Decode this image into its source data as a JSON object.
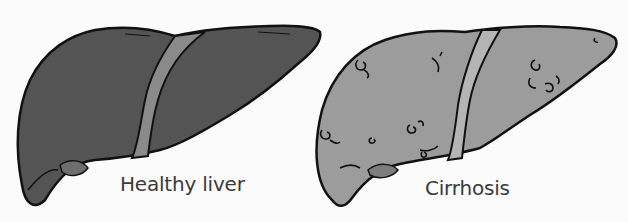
{
  "figure": {
    "panels": [
      {
        "id": "healthy",
        "label": "Healthy liver",
        "fill_color": "#545454",
        "ligament_color": "#8a8a8a",
        "accent_color": "#6e6e6e"
      },
      {
        "id": "cirrhosis",
        "label": "Cirrhosis",
        "fill_color": "#9c9c9c",
        "ligament_color": "#b5b5b5",
        "accent_color": "#7d7d7d"
      }
    ],
    "outline_color": "#111111",
    "background_color": "#fbfbfb"
  }
}
